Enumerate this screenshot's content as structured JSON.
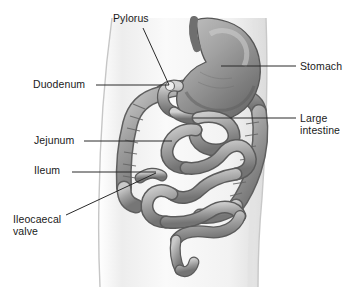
{
  "figure": {
    "background_color": "#ffffff",
    "width": 355,
    "height": 287
  },
  "palette": {
    "body_outline": "#cfcfcf",
    "body_fill_light": "#f6f6f6",
    "body_fill_mid": "#e3e3e3",
    "organ_light": "#c8c8c8",
    "organ_mid": "#9a9a9a",
    "organ_dark": "#6e6e6e",
    "organ_outline": "#5b5b5b",
    "stomach_light": "#b4b4b4",
    "stomach_dark": "#6a6a6a",
    "label_text": "#1a1a1a",
    "leader_line": "#2a2a2a"
  },
  "labels": [
    {
      "id": "pylorus",
      "text": "Pylorus",
      "x": 113,
      "y": 13,
      "align": "left",
      "leader": {
        "type": "diagonal",
        "x1": 143,
        "y1": 28,
        "x2": 169,
        "y2": 85
      }
    },
    {
      "id": "duodenum",
      "text": "Duodenum",
      "x": 33,
      "y": 79,
      "align": "left",
      "leader": {
        "type": "horizontal",
        "x1": 96,
        "y1": 85,
        "x2": 169,
        "y2": 85
      }
    },
    {
      "id": "stomach",
      "text": "Stomach",
      "x": 300,
      "y": 61,
      "align": "left",
      "leader": {
        "type": "horizontal",
        "x1": 221,
        "y1": 66,
        "x2": 296,
        "y2": 66
      }
    },
    {
      "id": "large-intestine",
      "text": "Large\nintestine",
      "x": 300,
      "y": 113,
      "align": "left",
      "leader": {
        "type": "horizontal",
        "x1": 193,
        "y1": 118,
        "x2": 296,
        "y2": 118
      }
    },
    {
      "id": "jejunum",
      "text": "Jejunum",
      "x": 34,
      "y": 135,
      "align": "left",
      "leader": {
        "type": "horizontal",
        "x1": 84,
        "y1": 141,
        "x2": 172,
        "y2": 141
      }
    },
    {
      "id": "ileum",
      "text": "Ileum",
      "x": 34,
      "y": 165,
      "align": "left",
      "leader": {
        "type": "horizontal",
        "x1": 72,
        "y1": 172,
        "x2": 156,
        "y2": 172
      }
    },
    {
      "id": "ileocaecal-valve",
      "text": "Ileocaecal\nvalve",
      "x": 13,
      "y": 214,
      "align": "left",
      "leader": {
        "type": "diagonal",
        "x1": 66,
        "y1": 215,
        "x2": 156,
        "y2": 173
      }
    }
  ],
  "anatomy": [
    {
      "id": "torso",
      "name": "body-torso-outline"
    },
    {
      "id": "stomach",
      "name": "stomach"
    },
    {
      "id": "pylorus",
      "name": "pylorus"
    },
    {
      "id": "duodenum",
      "name": "duodenum"
    },
    {
      "id": "large-intestine",
      "name": "large-intestine"
    },
    {
      "id": "jejunum",
      "name": "jejunum"
    },
    {
      "id": "ileum",
      "name": "ileum"
    },
    {
      "id": "ileocaecal-valve",
      "name": "ileocaecal-valve"
    }
  ]
}
